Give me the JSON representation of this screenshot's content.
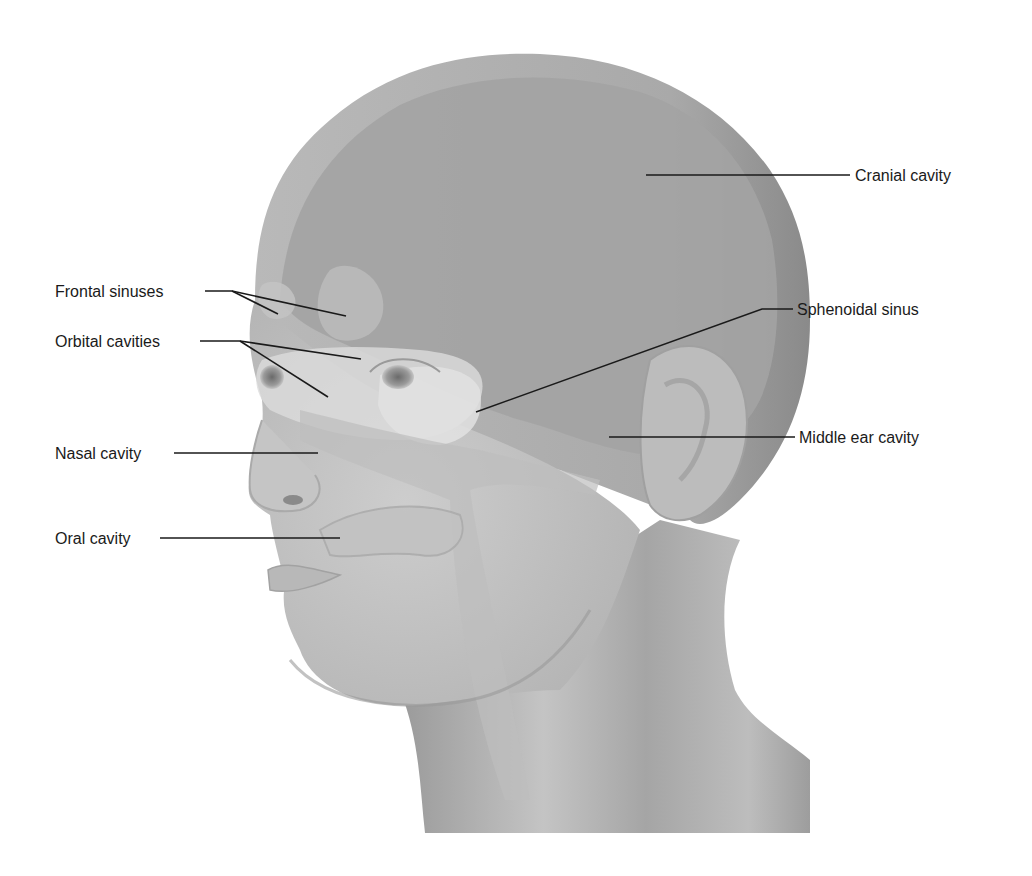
{
  "figure": {
    "colors": {
      "background": "#ffffff",
      "skin_light": "#c9c9c9",
      "skin_mid": "#b3b3b3",
      "skull_outer": "#a8a8a8",
      "cranial_inner": "#9e9e9e",
      "cavity_highlight": "#dcdcdc",
      "shadow": "#7d7d7d",
      "leader_line": "#1a1a1a",
      "label_text": "#1a1a1a"
    }
  },
  "labels": {
    "cranial_cavity": "Cranial cavity",
    "frontal_sinuses": "Frontal sinuses",
    "orbital_cavities": "Orbital cavities",
    "sphenoidal_sinus": "Sphenoidal sinus",
    "nasal_cavity": "Nasal cavity",
    "middle_ear_cavity": "Middle ear cavity",
    "oral_cavity": "Oral cavity"
  },
  "corner_mark": ")"
}
